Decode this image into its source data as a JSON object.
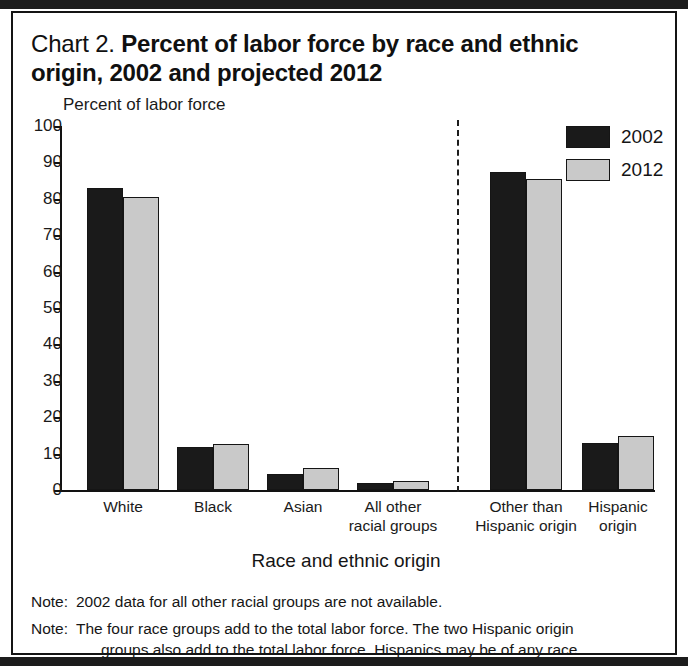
{
  "title": {
    "prefix": "Chart 2.",
    "main": "Percent of labor force by race and ethnic origin, 2002 and projected 2012"
  },
  "legend": {
    "items": [
      {
        "label": "2002",
        "color": "#1a1a1a"
      },
      {
        "label": "2012",
        "color": "#c9c9c9"
      }
    ]
  },
  "notes": [
    {
      "tag": "Note:",
      "line1": "2002 data for all other racial groups are not available.",
      "line2": ""
    },
    {
      "tag": "Note:",
      "line1": "The four race groups add to the total labor force. The two Hispanic origin",
      "line2": "groups also add to the total labor force. Hispanics may be of any race."
    }
  ],
  "chart_data": {
    "type": "bar",
    "title": "Chart 2. Percent of labor force by race and ethnic origin, 2002 and projected 2012",
    "xlabel": "Race and ethnic origin",
    "ylabel": "Percent of labor force",
    "ylim": [
      0,
      100
    ],
    "yticks": [
      0,
      10,
      20,
      30,
      40,
      50,
      60,
      70,
      80,
      90,
      100
    ],
    "grid": false,
    "legend_position": "top-right",
    "categories": [
      "White",
      "Black",
      "Asian",
      "All other racial groups",
      "Other than Hispanic origin",
      "Hispanic origin"
    ],
    "category_lines": [
      [
        "White"
      ],
      [
        "Black"
      ],
      [
        "Asian"
      ],
      [
        "All other",
        "racial groups"
      ],
      [
        "Other than",
        "Hispanic origin"
      ],
      [
        "Hispanic",
        "origin"
      ]
    ],
    "series": [
      {
        "name": "2002",
        "color": "#1a1a1a",
        "values": [
          83.0,
          11.8,
          4.4,
          2.0,
          87.5,
          12.8
        ]
      },
      {
        "name": "2012",
        "color": "#c9c9c9",
        "values": [
          80.5,
          12.7,
          6.0,
          2.6,
          85.4,
          14.9
        ]
      }
    ],
    "annotations": [
      {
        "type": "vertical-dashed-line",
        "after_category": "All other racial groups"
      }
    ]
  }
}
